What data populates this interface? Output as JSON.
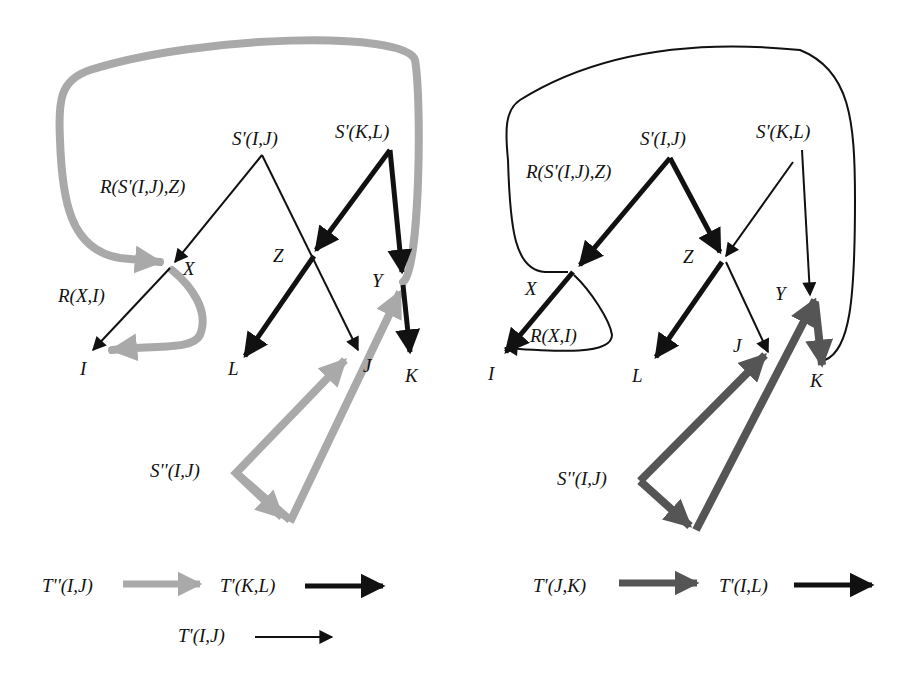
{
  "colors": {
    "black": "#111111",
    "light_gray": "#a9a9a9",
    "dark_gray": "#555555"
  },
  "left": {
    "nodes": {
      "sij": "S'(I,J)",
      "skl": "S'(K,L)",
      "r_sij_z": "R(S'(I,J),Z)",
      "x": "X",
      "z": "Z",
      "y": "Y",
      "r_x_i": "R(X,I)",
      "i": "I",
      "l": "L",
      "j": "J",
      "k": "K",
      "s2ij": "S''(I,J)"
    },
    "legend": [
      {
        "label": "T''(I,J)",
        "style": "light-gray-thick"
      },
      {
        "label": "T'(K,L)",
        "style": "black-thick"
      },
      {
        "label": "T'(I,J)",
        "style": "black-thin"
      }
    ]
  },
  "right": {
    "nodes": {
      "sij": "S'(I,J)",
      "skl": "S'(K,L)",
      "r_sij_z": "R(S'(I,J),Z)",
      "x": "X",
      "z": "Z",
      "y": "Y",
      "r_x_i": "R(X,I)",
      "i": "I",
      "l": "L",
      "j": "J",
      "k": "K",
      "s2ij": "S''(I,J)"
    },
    "legend": [
      {
        "label": "T'(J,K)",
        "style": "dark-gray-thick"
      },
      {
        "label": "T'(I,L)",
        "style": "black-thick"
      }
    ]
  }
}
